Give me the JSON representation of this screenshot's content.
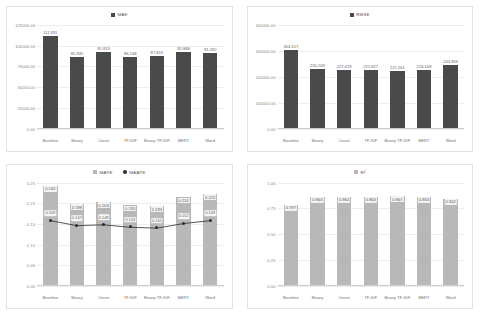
{
  "chart_data": [
    {
      "id": "mae",
      "type": "bar",
      "title": "MAE",
      "legend": [
        {
          "label": "MAE",
          "color": "#4a4a4a",
          "marker": "square"
        }
      ],
      "legend_position": "top-center",
      "grid": true,
      "xlabel": "",
      "ylabel": "",
      "categories": [
        "Baseline",
        "Binary",
        "Count",
        "TF-IDF",
        "Binary TF-IDF",
        "BERT",
        "Word"
      ],
      "values": [
        111931,
        85945,
        91813,
        86548,
        87824,
        92888,
        91282
      ],
      "value_labels": [
        "111,931",
        "85,945",
        "91,813",
        "86,548",
        "87,824",
        "92,888",
        "91,282"
      ],
      "ylim": [
        0,
        125000
      ],
      "yticks": [
        0,
        25000,
        50000,
        75000,
        100000,
        125000
      ],
      "ytick_labels": [
        "0.00",
        "25000.00",
        "50000.00",
        "75000.00",
        "100000.00",
        "125000.00"
      ],
      "bar_color": "#4a4a4a"
    },
    {
      "id": "rmse",
      "type": "bar",
      "title": "RMSE",
      "legend": [
        {
          "label": "RMSE",
          "color": "#4a4a4a",
          "marker": "square"
        }
      ],
      "legend_position": "top-center",
      "grid": true,
      "xlabel": "",
      "ylabel": "",
      "categories": [
        "Baseline",
        "Binary",
        "Count",
        "TF-IDF",
        "Binary TF-IDF",
        "BERT",
        "Word"
      ],
      "values": [
        304317,
        230209,
        227619,
        225827,
        221561,
        226168,
        244856
      ],
      "value_labels": [
        "304,317",
        "230,209",
        "227,619",
        "225,827",
        "221,561",
        "226,168",
        "244,856"
      ],
      "ylim": [
        0,
        400000
      ],
      "yticks": [
        0,
        100000,
        200000,
        300000,
        400000
      ],
      "ytick_labels": [
        "0.00",
        "100000.00",
        "200000.00",
        "300000.00",
        "400000.00"
      ],
      "bar_color": "#4a4a4a"
    },
    {
      "id": "mape",
      "type": "bar",
      "title": "MAPE / MAAPE",
      "legend": [
        {
          "label": "MAPE",
          "color": "#b8b8b8",
          "marker": "square"
        },
        {
          "label": "MAAPE",
          "color": "#2b2b2b",
          "marker": "circle"
        }
      ],
      "legend_position": "top-center",
      "grid": true,
      "xlabel": "",
      "ylabel": "",
      "categories": [
        "Baseline",
        "Binary",
        "Count",
        "TF-IDF",
        "Binary TF-IDF",
        "BERT",
        "Word"
      ],
      "series": [
        {
          "name": "MAPE",
          "kind": "bar",
          "values": [
            0.242,
            0.198,
            0.203,
            0.195,
            0.193,
            0.214,
            0.222
          ],
          "value_labels": [
            "0.242",
            "0.198",
            "0.203",
            "0.195",
            "0.193",
            "0.214",
            "0.222"
          ],
          "color": "#b8b8b8"
        },
        {
          "name": "MAAPE",
          "kind": "line",
          "values": [
            0.159,
            0.147,
            0.149,
            0.143,
            0.141,
            0.152,
            0.159
          ],
          "value_labels": [
            "0.159",
            "0.147",
            "0.149",
            "0.143",
            "0.141",
            "0.152",
            "0.159"
          ],
          "color": "#2b2b2b"
        }
      ],
      "ylim": [
        0,
        0.25
      ],
      "yticks": [
        0,
        0.05,
        0.1,
        0.15,
        0.2,
        0.25
      ],
      "ytick_labels": [
        "0.00",
        "0.05",
        "0.10",
        "0.15",
        "0.20",
        "0.25"
      ]
    },
    {
      "id": "r2",
      "type": "bar",
      "title": "R²",
      "legend": [
        {
          "label": "R²",
          "color": "#b8b8b8",
          "marker": "square"
        }
      ],
      "legend_position": "top-center",
      "grid": true,
      "xlabel": "",
      "ylabel": "",
      "categories": [
        "Baseline",
        "Binary",
        "Count",
        "TF-IDF",
        "Binary TF-IDF",
        "BERT",
        "Word"
      ],
      "values": [
        0.787,
        0.863,
        0.862,
        0.863,
        0.867,
        0.863,
        0.842
      ],
      "value_labels": [
        "0.787",
        "0.863",
        "0.862",
        "0.863",
        "0.867",
        "0.863",
        "0.842"
      ],
      "ylim": [
        0,
        1.0
      ],
      "yticks": [
        0,
        0.25,
        0.5,
        0.75,
        1.0
      ],
      "ytick_labels": [
        "0.00",
        "0.25",
        "0.50",
        "0.75",
        "1.00"
      ],
      "bar_color": "#b8b8b8"
    }
  ]
}
